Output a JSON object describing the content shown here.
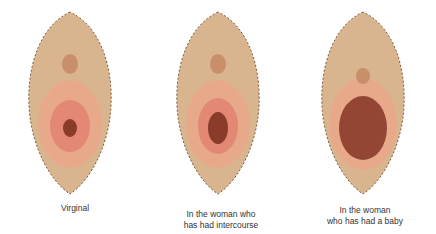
{
  "diagram": {
    "panels": [
      {
        "id": "panel-1",
        "label_lines": [
          "Virginal"
        ]
      },
      {
        "id": "panel-2",
        "label_lines": [
          "In the woman who",
          "has had intercourse"
        ]
      },
      {
        "id": "panel-3",
        "label_lines": [
          "In the woman",
          "who has had a baby"
        ]
      }
    ],
    "colors": {
      "outer": "#d9b58f",
      "mid": "#e8a98a",
      "inner": "#e07f6e",
      "center": "#8a3b2a",
      "hair": "#6b4a2f",
      "background": "#ffffff"
    }
  }
}
